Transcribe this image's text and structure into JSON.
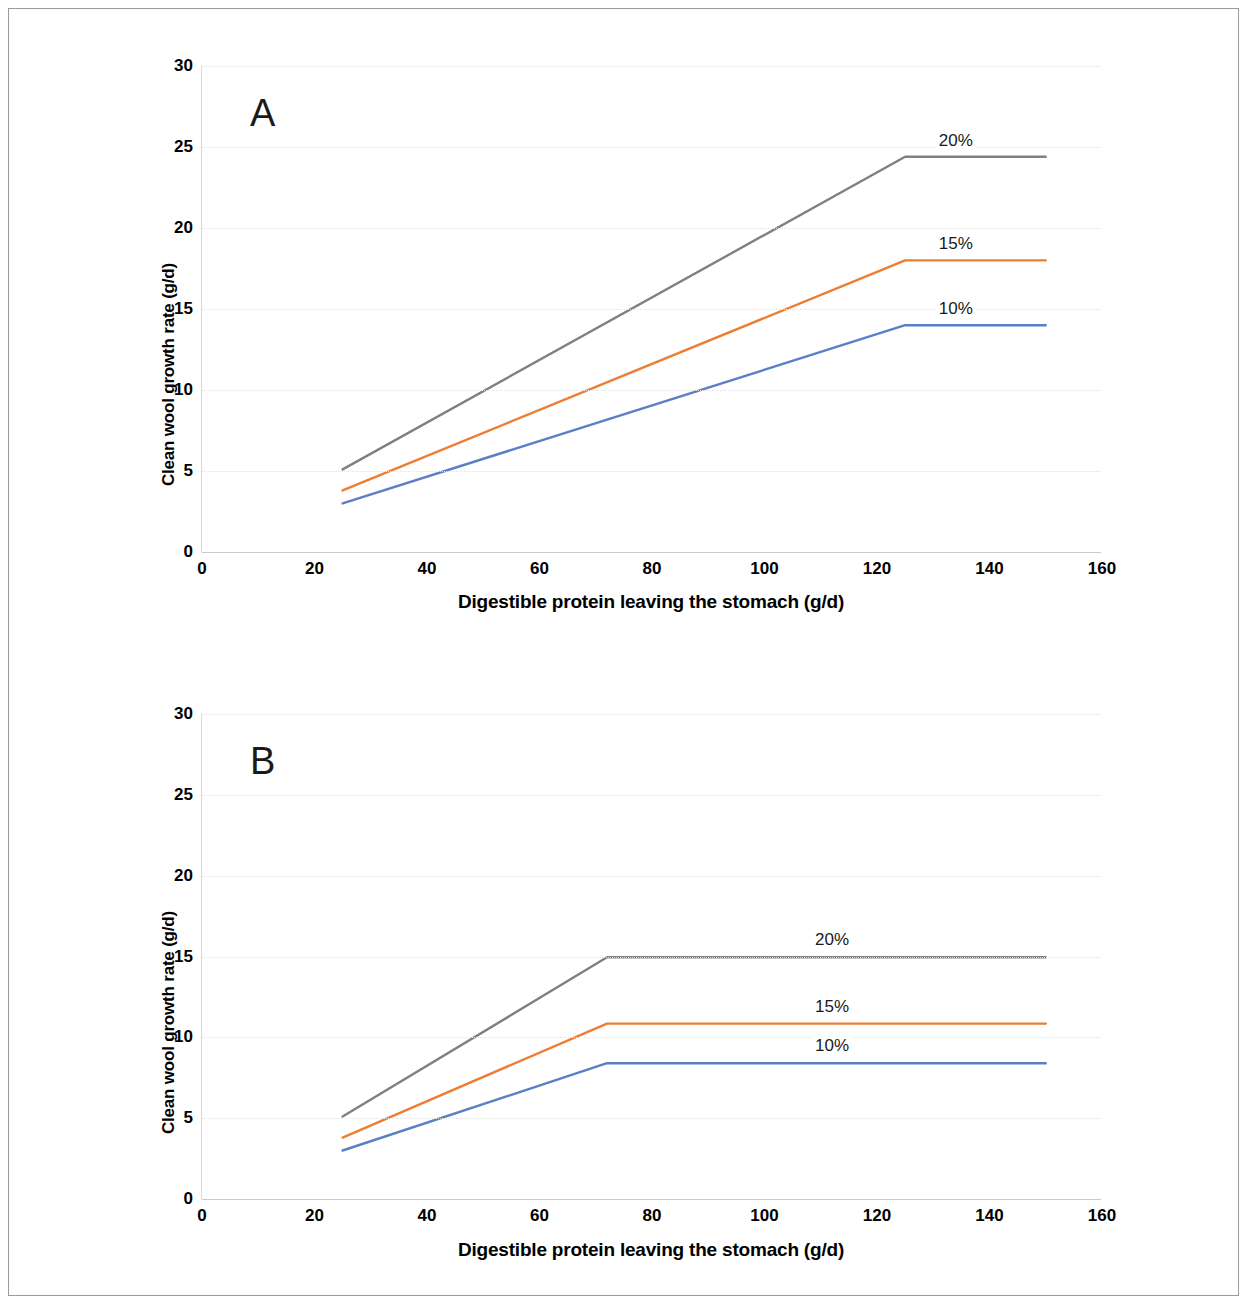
{
  "figure": {
    "panels": [
      {
        "letter": "A",
        "x_axis_title": "Digestible protein leaving the stomach (g/d)",
        "y_axis_title": "Clean wool growth rate (g/d)",
        "x_ticks": [
          "0",
          "20",
          "40",
          "60",
          "80",
          "100",
          "120",
          "140",
          "160"
        ],
        "y_ticks": [
          "0",
          "5",
          "10",
          "15",
          "20",
          "25",
          "30"
        ]
      },
      {
        "letter": "B",
        "x_axis_title": "Digestible protein leaving the stomach (g/d)",
        "y_axis_title": "Clean wool growth rate (g/d)",
        "x_ticks": [
          "0",
          "20",
          "40",
          "60",
          "80",
          "100",
          "120",
          "140",
          "160"
        ],
        "y_ticks": [
          "0",
          "5",
          "10",
          "15",
          "20",
          "25",
          "30"
        ]
      }
    ]
  },
  "colors": {
    "blue": "#5B7FC7",
    "orange": "#ED7D31",
    "gray": "#808080",
    "gridline": "#E2E2E2",
    "axis": "#C9C9C9",
    "frame": "#9A9A9A"
  },
  "chart_data": [
    {
      "type": "line",
      "title": "A",
      "xlabel": "Digestible protein leaving the stomach (g/d)",
      "ylabel": "Clean wool growth rate (g/d)",
      "xlim": [
        0,
        160
      ],
      "ylim": [
        0,
        30
      ],
      "xticks": [
        0,
        20,
        40,
        60,
        80,
        100,
        120,
        140,
        160
      ],
      "yticks": [
        0,
        5,
        10,
        15,
        20,
        25,
        30
      ],
      "grid": true,
      "legend_position": "inline-right-of-plateau",
      "series": [
        {
          "name": "20%",
          "color": "#808080",
          "x": [
            25,
            125,
            150
          ],
          "y": [
            5.1,
            24.4,
            24.4
          ],
          "label": "20%",
          "label_x": 134,
          "label_y": 25.4
        },
        {
          "name": "15%",
          "color": "#ED7D31",
          "x": [
            25,
            125,
            150
          ],
          "y": [
            3.8,
            18.0,
            18.0
          ],
          "label": "15%",
          "label_x": 134,
          "label_y": 19.0
        },
        {
          "name": "10%",
          "color": "#5B7FC7",
          "x": [
            25,
            125,
            150
          ],
          "y": [
            3.0,
            14.0,
            14.0
          ],
          "label": "10%",
          "label_x": 134,
          "label_y": 15.0
        }
      ]
    },
    {
      "type": "line",
      "title": "B",
      "xlabel": "Digestible protein leaving the stomach (g/d)",
      "ylabel": "Clean wool growth rate (g/d)",
      "xlim": [
        0,
        160
      ],
      "ylim": [
        0,
        30
      ],
      "xticks": [
        0,
        20,
        40,
        60,
        80,
        100,
        120,
        140,
        160
      ],
      "yticks": [
        0,
        5,
        10,
        15,
        20,
        25,
        30
      ],
      "grid": true,
      "legend_position": "inline-above-plateau",
      "series": [
        {
          "name": "20%",
          "color": "#808080",
          "x": [
            25,
            72,
            150
          ],
          "y": [
            5.1,
            14.95,
            14.95
          ],
          "label": "20%",
          "label_x": 112,
          "label_y": 16.0
        },
        {
          "name": "15%",
          "color": "#ED7D31",
          "x": [
            25,
            72,
            150
          ],
          "y": [
            3.8,
            10.85,
            10.85
          ],
          "label": "15%",
          "label_x": 112,
          "label_y": 11.9
        },
        {
          "name": "10%",
          "color": "#5B7FC7",
          "x": [
            25,
            72,
            150
          ],
          "y": [
            3.0,
            8.4,
            8.4
          ],
          "label": "10%",
          "label_x": 112,
          "label_y": 9.45
        }
      ]
    }
  ]
}
